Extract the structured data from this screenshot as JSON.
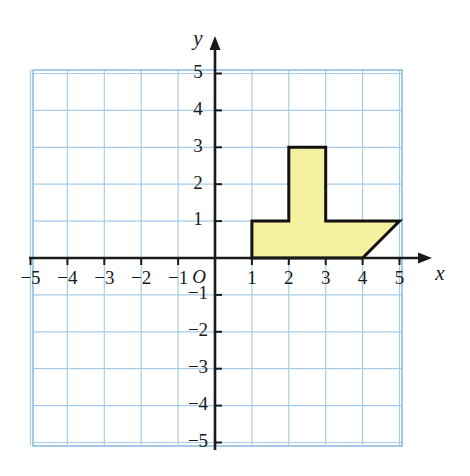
{
  "figure": {
    "type": "coordinate-plane-polygon",
    "background_color": "#ffffff"
  },
  "chart_data": {
    "type": "scatter",
    "title": "",
    "xlabel": "x",
    "ylabel": "y",
    "xlim": [
      -5,
      5
    ],
    "ylim": [
      -5,
      5
    ],
    "grid": true,
    "grid_step": 1,
    "legend": "none",
    "origin_label": "O",
    "x_tick_labels": [
      "−5",
      "−4",
      "−3",
      "−2",
      "−1",
      "1",
      "2",
      "3",
      "4",
      "5"
    ],
    "x_tick_values": [
      -5,
      -4,
      -3,
      -2,
      -1,
      1,
      2,
      3,
      4,
      5
    ],
    "y_tick_labels": [
      "5",
      "4",
      "3",
      "2",
      "1",
      "−1",
      "−2",
      "−3",
      "−4",
      "−5"
    ],
    "y_tick_values": [
      5,
      4,
      3,
      2,
      1,
      -1,
      -2,
      -3,
      -4,
      -5
    ],
    "series": [
      {
        "name": "polygon",
        "kind": "closed-polygon",
        "fill_color": "#f5f0a0",
        "stroke_color": "#111111",
        "stroke_width": 3,
        "vertices": [
          [
            1,
            0
          ],
          [
            1,
            1
          ],
          [
            2,
            1
          ],
          [
            2,
            3
          ],
          [
            3,
            3
          ],
          [
            3,
            1
          ],
          [
            5,
            1
          ],
          [
            4,
            0
          ]
        ]
      }
    ]
  },
  "colors": {
    "grid_line": "#a8cce8",
    "grid_border": "#8fbddf",
    "axis": "#1a1a1a",
    "polygon_fill": "#f5f0a0",
    "polygon_stroke": "#111111",
    "text": "#1a1a1a"
  },
  "geometry": {
    "origin_px": [
      215,
      258
    ],
    "unit_px": 36.9,
    "grid_left_px": 33,
    "grid_right_px": 402,
    "grid_top_px": 70,
    "grid_bottom_px": 446
  }
}
